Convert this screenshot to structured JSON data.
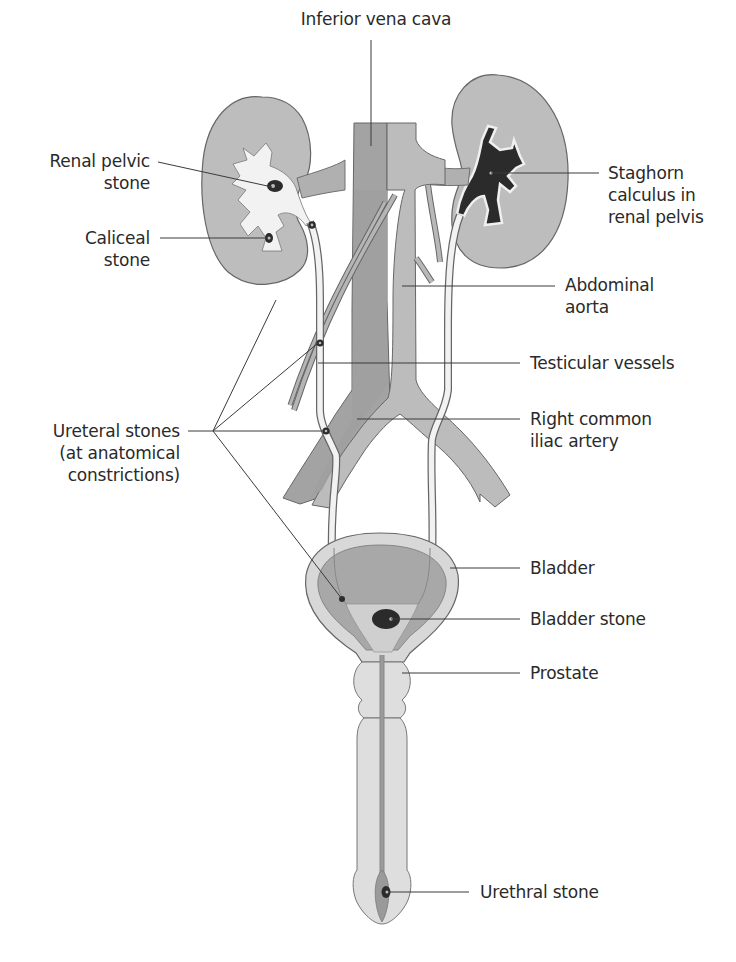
{
  "figure": {
    "colors": {
      "background": "#ffffff",
      "organ_fill": "#bcbcbc",
      "organ_dark": "#9a9a9a",
      "vessel_fill": "#b5b5b5",
      "vein_fill": "#a3a3a3",
      "lumen_fill": "#f2f2f2",
      "stone_fill": "#2b2b2b",
      "outline": "#555555",
      "leader_line": "#3a3a3a",
      "text": "#2a2a2a"
    }
  },
  "labels": {
    "inferior_vena_cava": "Inferior vena cava",
    "renal_pelvic_stone": "Renal pelvic\nstone",
    "caliceal_stone": "Caliceal\nstone",
    "staghorn_calculus": "Staghorn\ncalculus in\nrenal pelvis",
    "abdominal_aorta": "Abdominal\naorta",
    "testicular_vessels": "Testicular vessels",
    "ureteral_stones": "Ureteral stones\n(at anatomical\nconstrictions)",
    "right_common_iliac_artery": "Right common\niliac artery",
    "bladder": "Bladder",
    "bladder_stone": "Bladder stone",
    "prostate": "Prostate",
    "urethral_stone": "Urethral stone"
  },
  "leaders": [
    {
      "id": "inferior_vena_cava",
      "x1": 371,
      "y1": 40,
      "x2": 371,
      "y2": 146
    },
    {
      "id": "renal_pelvic_stone",
      "x1": 158,
      "y1": 162,
      "x2": 272,
      "y2": 187
    },
    {
      "id": "caliceal_stone",
      "x1": 160,
      "y1": 238,
      "x2": 268,
      "y2": 238
    },
    {
      "id": "staghorn_calculus",
      "x1": 491,
      "y1": 173,
      "x2": 599,
      "y2": 173
    },
    {
      "id": "abdominal_aorta",
      "x1": 402,
      "y1": 286,
      "x2": 555,
      "y2": 286
    },
    {
      "id": "testicular_vessels",
      "x1": 318,
      "y1": 363,
      "x2": 520,
      "y2": 363
    },
    {
      "id": "ureteral_a",
      "x1": 213,
      "y1": 431,
      "x2": 276,
      "y2": 300
    },
    {
      "id": "ureteral_b",
      "x1": 213,
      "y1": 431,
      "x2": 318,
      "y2": 343
    },
    {
      "id": "ureteral_c",
      "x1": 188,
      "y1": 431,
      "x2": 325,
      "y2": 431
    },
    {
      "id": "ureteral_d",
      "x1": 213,
      "y1": 431,
      "x2": 342,
      "y2": 599
    },
    {
      "id": "right_common_iliac_artery",
      "x1": 357,
      "y1": 419,
      "x2": 520,
      "y2": 419
    },
    {
      "id": "bladder",
      "x1": 450,
      "y1": 568,
      "x2": 520,
      "y2": 568
    },
    {
      "id": "bladder_stone",
      "x1": 391,
      "y1": 619,
      "x2": 520,
      "y2": 619
    },
    {
      "id": "prostate",
      "x1": 402,
      "y1": 673,
      "x2": 520,
      "y2": 673
    },
    {
      "id": "urethral_stone",
      "x1": 388,
      "y1": 892,
      "x2": 469,
      "y2": 892
    }
  ]
}
